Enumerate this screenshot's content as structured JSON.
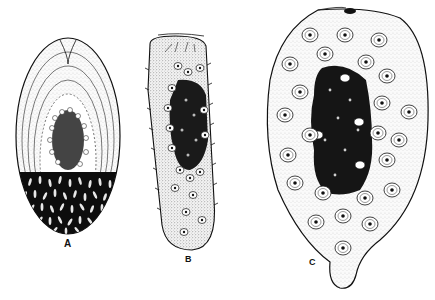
{
  "figure": {
    "panels": [
      {
        "label": "A",
        "description": "Oval organism with concentric outer layers, clustered central cells and densely packed dark lower half with elongated light granules"
      },
      {
        "label": "B",
        "description": "Elongated club-shaped organism with spines along margins, dark central mass and scattered nucleated cells"
      },
      {
        "label": "C",
        "description": "Large pear-shaped organism with stippled body, dark central cell mass surrounded by ring of nucleated cells and a posterior tail-like projection"
      }
    ],
    "colors": {
      "background": "#ffffff",
      "ink": "#111111",
      "stipple": "#f2f2f2"
    }
  }
}
